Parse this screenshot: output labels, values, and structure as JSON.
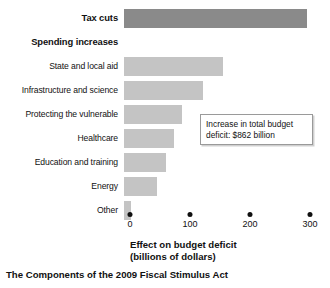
{
  "chart_data": {
    "type": "bar",
    "orientation": "horizontal",
    "title": "The Components of the 2009 Fiscal Stimulus Act",
    "xlabel_line1": "Effect on budget deficit",
    "xlabel_line2": "(billions of dollars)",
    "ylabel": "",
    "xlim": [
      0,
      300
    ],
    "xticks": [
      0,
      100,
      200,
      300
    ],
    "xtick_labels": [
      "0",
      "100",
      "200",
      "300"
    ],
    "grid": false,
    "legend": "none",
    "group_header": "Spending increases",
    "categories": [
      "Tax cuts",
      "State and local aid",
      "Infrastructure and science",
      "Protecting the vulnerable",
      "Healthcare",
      "Education and training",
      "Energy",
      "Other"
    ],
    "values": [
      305,
      165,
      132,
      96,
      83,
      70,
      55,
      12
    ],
    "rows": [
      {
        "label": "Tax cuts",
        "value": 305,
        "kind": "bar",
        "emphasis": "bold",
        "color": "#8a8a8a"
      },
      {
        "label": "Spending increases",
        "value": null,
        "kind": "header",
        "emphasis": "bold",
        "color": ""
      },
      {
        "label": "State and local aid",
        "value": 165,
        "kind": "bar",
        "emphasis": "normal",
        "color": "#c4c4c4"
      },
      {
        "label": "Infrastructure and science",
        "value": 132,
        "kind": "bar",
        "emphasis": "normal",
        "color": "#c4c4c4"
      },
      {
        "label": "Protecting the vulnerable",
        "value": 96,
        "kind": "bar",
        "emphasis": "normal",
        "color": "#c4c4c4"
      },
      {
        "label": "Healthcare",
        "value": 83,
        "kind": "bar",
        "emphasis": "normal",
        "color": "#c4c4c4"
      },
      {
        "label": "Education and training",
        "value": 70,
        "kind": "bar",
        "emphasis": "normal",
        "color": "#c4c4c4"
      },
      {
        "label": "Energy",
        "value": 55,
        "kind": "bar",
        "emphasis": "normal",
        "color": "#c4c4c4"
      },
      {
        "label": "Other",
        "value": 12,
        "kind": "bar",
        "emphasis": "normal",
        "color": "#c4c4c4"
      }
    ],
    "annotation": {
      "line1": "Increase in total budget",
      "line2": "deficit: $862 billion",
      "text": "Increase in total budget deficit: $862 billion"
    },
    "colors": {
      "tax_cuts_bar": "#8a8a8a",
      "spending_bar": "#c4c4c4",
      "text": "#111111",
      "annotation_border": "#9a9a9a",
      "background": "#ffffff"
    }
  }
}
